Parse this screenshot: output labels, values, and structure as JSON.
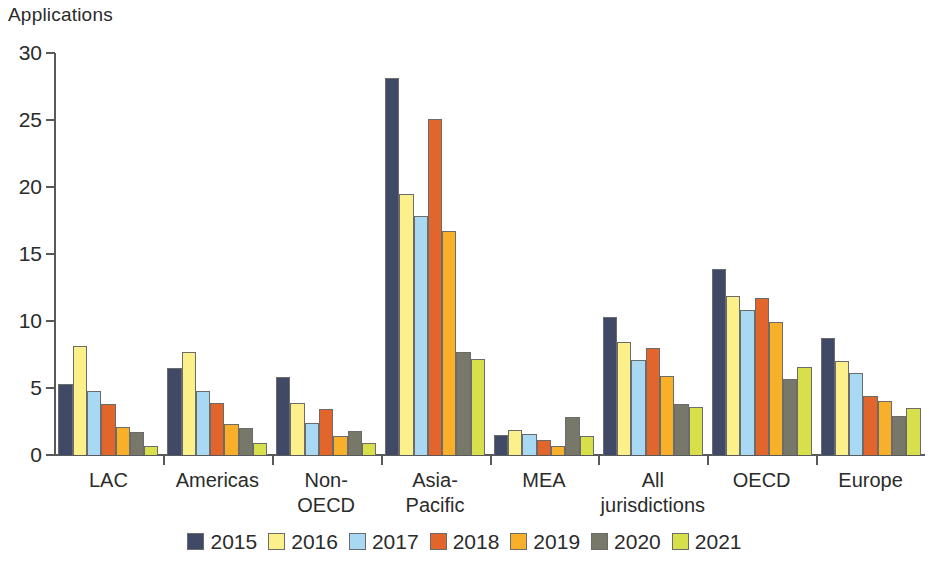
{
  "chart_data": {
    "type": "bar",
    "title": "",
    "ylabel": "Applications",
    "xlabel": "",
    "ylim": [
      0,
      30
    ],
    "yticks": [
      0,
      5,
      10,
      15,
      20,
      25,
      30
    ],
    "ytick_labels": [
      "0",
      "5",
      "10",
      "15",
      "20",
      "25",
      "30"
    ],
    "grid": false,
    "legend_position": "bottom",
    "categories": [
      "LAC",
      "Americas",
      "Non-\nOECD",
      "Asia-\nPacific",
      "MEA",
      "All\njurisdictions",
      "OECD",
      "Europe"
    ],
    "series": [
      {
        "name": "2015",
        "color": "#404a66",
        "values": [
          5.3,
          6.5,
          5.8,
          28.1,
          1.5,
          10.3,
          13.9,
          8.7
        ]
      },
      {
        "name": "2016",
        "color": "#fbf08a",
        "values": [
          8.1,
          7.7,
          3.9,
          19.5,
          1.9,
          8.4,
          11.9,
          7.0
        ]
      },
      {
        "name": "2017",
        "color": "#a9d8f2",
        "values": [
          4.8,
          4.8,
          2.4,
          17.8,
          1.6,
          7.1,
          10.8,
          6.1
        ]
      },
      {
        "name": "2018",
        "color": "#e2662c",
        "values": [
          3.8,
          3.9,
          3.4,
          25.1,
          1.1,
          8.0,
          11.7,
          4.4
        ]
      },
      {
        "name": "2019",
        "color": "#f8b02a",
        "values": [
          2.1,
          2.3,
          1.4,
          16.7,
          0.7,
          5.9,
          9.9,
          4.0
        ]
      },
      {
        "name": "2020",
        "color": "#77776a",
        "values": [
          1.7,
          2.0,
          1.8,
          7.7,
          2.8,
          3.8,
          5.7,
          2.9
        ]
      },
      {
        "name": "2021",
        "color": "#d7e04a",
        "values": [
          0.7,
          0.9,
          0.9,
          7.2,
          1.4,
          3.6,
          6.6,
          3.5
        ]
      }
    ]
  }
}
